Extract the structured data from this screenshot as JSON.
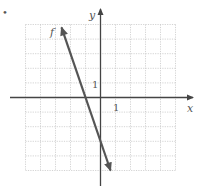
{
  "chart_data": {
    "type": "line",
    "title": "",
    "xlabel": "x",
    "ylabel": "y",
    "xlim": [
      -5,
      5
    ],
    "ylim": [
      -5,
      5
    ],
    "grid": true,
    "tick_labels": {
      "x": "1",
      "y": "1"
    },
    "series": [
      {
        "name": "f",
        "equation": "f(x) = -3x - 3",
        "x": [
          -2.6,
          -1,
          0,
          0.67
        ],
        "y": [
          4.8,
          0,
          -3,
          -5
        ]
      }
    ],
    "annotations": [
      {
        "text": "f",
        "x": -2.95,
        "y": 4.6
      }
    ]
  },
  "labels": {
    "x_axis": "x",
    "y_axis": "y",
    "x_tick": "1",
    "y_tick": "1",
    "curve": "f",
    "bullet": "•"
  },
  "colors": {
    "grid": "#c8c8c8",
    "axis": "#444444",
    "line": "#555555"
  }
}
